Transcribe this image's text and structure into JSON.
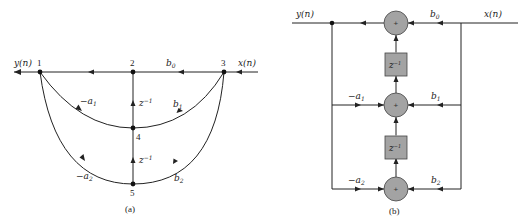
{
  "figure_a": {
    "caption": "(a)",
    "input_label": "x(n)",
    "output_label": "y(n)",
    "nodes": [
      {
        "id": "1",
        "label": "1"
      },
      {
        "id": "2",
        "label": "2"
      },
      {
        "id": "3",
        "label": "3"
      },
      {
        "id": "4",
        "label": "4"
      },
      {
        "id": "5",
        "label": "5"
      }
    ],
    "branches": {
      "b0": "b",
      "b0_sub": "0",
      "b1": "b",
      "b1_sub": "1",
      "b2": "b",
      "b2_sub": "2",
      "a1": "−a",
      "a1_sub": "1",
      "a2": "−a",
      "a2_sub": "2",
      "delay1": "z",
      "delay1_sup": "−1",
      "delay2": "z",
      "delay2_sup": "−1"
    }
  },
  "figure_b": {
    "caption": "(b)",
    "input_label": "x(n)",
    "output_label": "y(n)",
    "adder_symbol": "+",
    "delays": [
      {
        "label": "z",
        "sup": "−1"
      },
      {
        "label": "z",
        "sup": "−1"
      }
    ],
    "coefficients": {
      "b0": "b",
      "b0_sub": "0",
      "b1": "b",
      "b1_sub": "1",
      "b2": "b",
      "b2_sub": "2",
      "a1": "−a",
      "a1_sub": "1",
      "a2": "−a",
      "a2_sub": "2"
    }
  },
  "colors": {
    "line": "#222222",
    "block_fill": "#a3a3a3"
  }
}
